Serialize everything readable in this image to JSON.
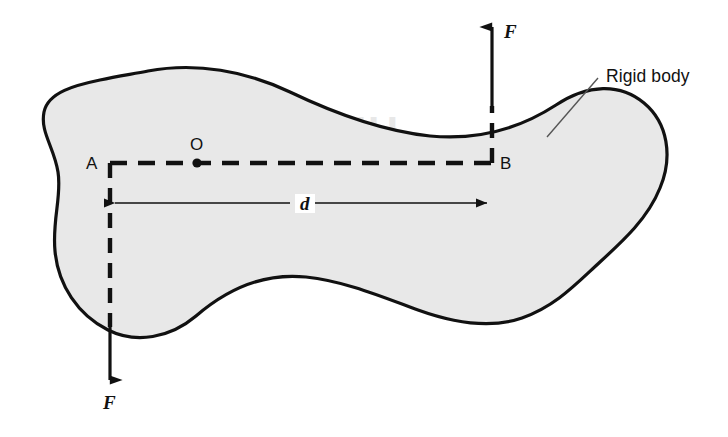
{
  "figure": {
    "kind": "physics-diagram",
    "background_color": "#ffffff"
  },
  "body": {
    "name": "Rigid body",
    "callout_label": "Rigid body",
    "fill_color": "#e8e8e8",
    "outline_color": "#111111",
    "outline_width": 3.2
  },
  "points": {
    "a": {
      "label": "A",
      "x": 110,
      "y": 163
    },
    "o": {
      "label": "O",
      "x": 197,
      "y": 163
    },
    "b": {
      "label": "B",
      "x": 492,
      "y": 163
    }
  },
  "forces": [
    {
      "label": "F",
      "direction": "up",
      "applied_at": "B",
      "x": 492,
      "tail_y": 163,
      "tip_y": 22,
      "color": "#111111"
    },
    {
      "label": "F",
      "direction": "down",
      "applied_at": "A",
      "x": 110,
      "tail_y": 163,
      "tip_y": 385,
      "color": "#111111"
    }
  ],
  "dimension": {
    "label": "d",
    "meaning": "perpendicular distance between the two forces",
    "from_x": 110,
    "to_x": 492,
    "y": 203,
    "arrow_style": "double-headed"
  },
  "lines": {
    "ab_line_style": "dashed",
    "ab_label": "A to B construction line"
  },
  "watermark": {
    "line1": "UILIBRIUM",
    "line2": "SS CENTRE"
  }
}
